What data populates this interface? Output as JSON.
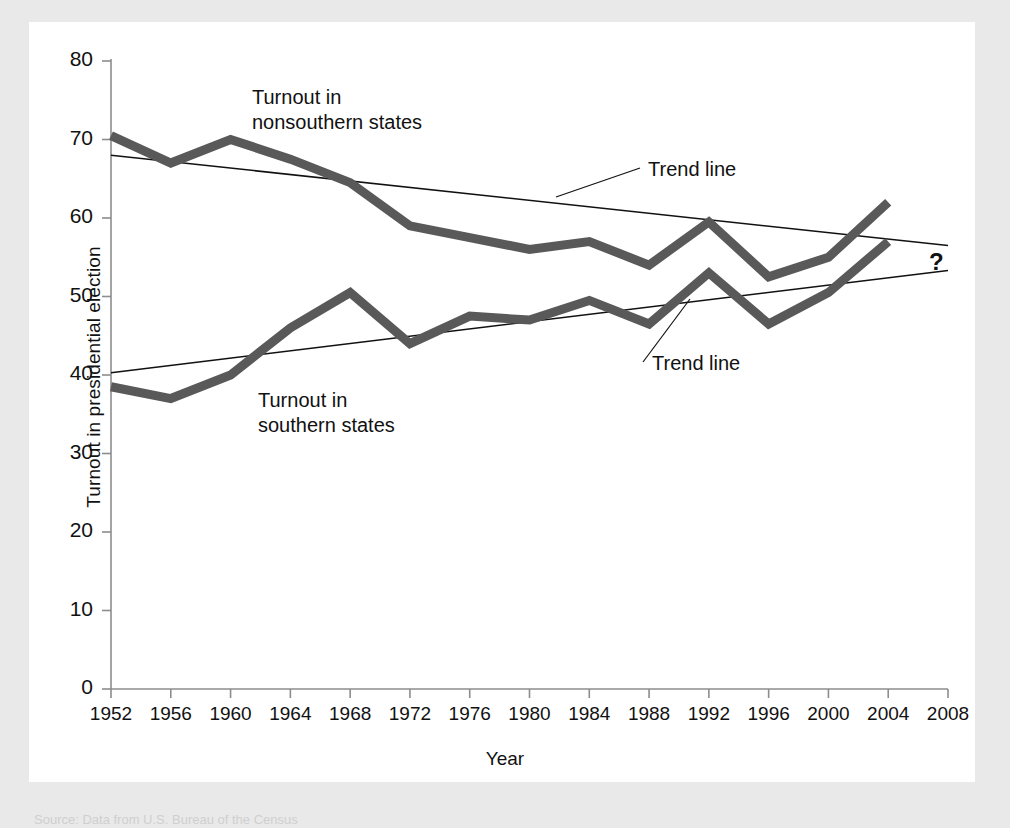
{
  "chart_data": {
    "type": "line",
    "title": "",
    "xlabel": "Year",
    "ylabel": "Turnout in presidential election",
    "xlim": [
      1952,
      2008
    ],
    "ylim": [
      0,
      80
    ],
    "yticks": [
      0,
      10,
      20,
      30,
      40,
      50,
      60,
      70,
      80
    ],
    "categories": [
      1952,
      1956,
      1960,
      1964,
      1968,
      1972,
      1976,
      1980,
      1984,
      1988,
      1992,
      1996,
      2000,
      2004
    ],
    "xticks": [
      1952,
      1956,
      1960,
      1964,
      1968,
      1972,
      1976,
      1980,
      1984,
      1988,
      1992,
      1996,
      2000,
      2004,
      2008
    ],
    "grid": false,
    "legend_position": "inline-annotations",
    "series": [
      {
        "name": "Turnout in nonsouthern states",
        "color": "#595959",
        "values": [
          70.5,
          67.0,
          70.0,
          67.5,
          64.5,
          59.0,
          57.5,
          56.0,
          57.0,
          54.0,
          59.5,
          52.5,
          55.0,
          62.0
        ]
      },
      {
        "name": "Turnout in southern states",
        "color": "#595959",
        "values": [
          38.5,
          37.0,
          40.0,
          46.0,
          50.5,
          44.0,
          47.5,
          47.0,
          49.5,
          46.5,
          53.0,
          46.5,
          50.5,
          57.0
        ]
      },
      {
        "name": "Trend line (nonsouthern)",
        "color": "#111111",
        "kind": "trend",
        "x": [
          1952,
          2008
        ],
        "values": [
          68.0,
          56.5
        ]
      },
      {
        "name": "Trend line (southern)",
        "color": "#111111",
        "kind": "trend",
        "x": [
          1952,
          2008
        ],
        "values": [
          40.3,
          53.3
        ]
      }
    ],
    "annotations": [
      {
        "text": "Turnout in nonsouthern states",
        "x": 1955.6,
        "y": 76.0
      },
      {
        "text": "Turnout in southern states",
        "x": 1957.0,
        "y": 35.0
      },
      {
        "text": "Trend line",
        "x": 1975.0,
        "y": 64.5
      },
      {
        "text": "Trend line",
        "x": 1989.0,
        "y": 43.0
      },
      {
        "text": "?",
        "x": 2009.5,
        "y": 55.0
      }
    ]
  },
  "axes": {
    "y_title": "Turnout in presidential election",
    "x_title": "Year",
    "y_tick_labels": [
      "80",
      "70",
      "60",
      "50",
      "40",
      "30",
      "20",
      "10",
      "0"
    ],
    "x_tick_labels": [
      "1952",
      "1956",
      "1960",
      "1964",
      "1968",
      "1972",
      "1976",
      "1980",
      "1984",
      "1988",
      "1992",
      "1996",
      "2000",
      "2004",
      "2008"
    ]
  },
  "labels": {
    "nonsouthern_line1": "Turnout in",
    "nonsouthern_line2": "nonsouthern states",
    "southern_line1": "Turnout in",
    "southern_line2": "southern states",
    "trend_upper": "Trend line",
    "trend_lower": "Trend line",
    "question_mark": "?"
  },
  "caption": {
    "text": "Source: Data from U.S. Bureau of the Census"
  },
  "colors": {
    "background": "#e9e9e9",
    "panel": "#ffffff",
    "series": "#595959",
    "trend": "#111111",
    "axis": "#8d8d8d",
    "text": "#111111"
  }
}
